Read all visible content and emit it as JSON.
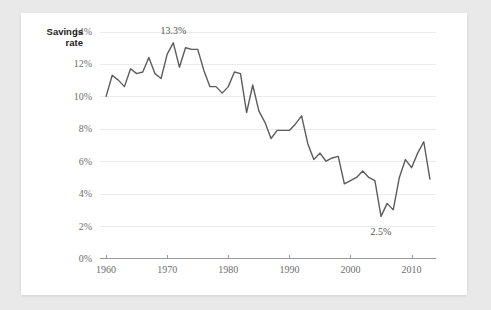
{
  "card": {
    "background": "#ffffff",
    "page_background": "#e9e9e9"
  },
  "chart_data": {
    "type": "line",
    "title": "",
    "series_label_line1": "Savings",
    "series_label_line2": "rate",
    "xlabel": "",
    "ylabel": "Savings rate",
    "xlim": [
      1959,
      2014
    ],
    "ylim": [
      0,
      14
    ],
    "grid": true,
    "legend_position": "none",
    "line_color": "#5c5c5c",
    "ytick_labels": [
      "0%",
      "2%",
      "4%",
      "6%",
      "8%",
      "10%",
      "12%",
      "14%"
    ],
    "ytick_values": [
      0,
      2,
      4,
      6,
      8,
      10,
      12,
      14
    ],
    "xtick_labels": [
      "1960",
      "1970",
      "1980",
      "1990",
      "2000",
      "2010"
    ],
    "xtick_values": [
      1960,
      1970,
      1980,
      1990,
      2000,
      2010
    ],
    "annotations": [
      {
        "label": "13.3%",
        "x": 1971,
        "y": 13.3
      },
      {
        "label": "2.5%",
        "x": 2005,
        "y": 2.5
      }
    ],
    "x": [
      1960,
      1961,
      1962,
      1963,
      1964,
      1965,
      1966,
      1967,
      1968,
      1969,
      1970,
      1971,
      1972,
      1973,
      1974,
      1975,
      1976,
      1977,
      1978,
      1979,
      1980,
      1981,
      1982,
      1983,
      1984,
      1985,
      1986,
      1987,
      1988,
      1989,
      1990,
      1991,
      1992,
      1993,
      1994,
      1995,
      1996,
      1997,
      1998,
      1999,
      2000,
      2001,
      2002,
      2003,
      2004,
      2005,
      2006,
      2007,
      2008,
      2009,
      2010,
      2011,
      2012,
      2013
    ],
    "values": [
      10.0,
      11.3,
      11.0,
      10.6,
      11.7,
      11.4,
      11.5,
      12.4,
      11.4,
      11.1,
      12.6,
      13.3,
      11.8,
      13.0,
      12.9,
      12.9,
      11.6,
      10.6,
      10.6,
      10.2,
      10.6,
      11.5,
      11.4,
      9.0,
      10.7,
      9.1,
      8.4,
      7.4,
      7.9,
      7.9,
      7.9,
      8.3,
      8.8,
      7.1,
      6.1,
      6.5,
      6.0,
      6.2,
      6.3,
      4.6,
      4.8,
      5.0,
      5.4,
      5.0,
      4.8,
      2.6,
      3.4,
      3.0,
      5.0,
      6.1,
      5.6,
      6.5,
      7.2,
      4.9
    ]
  }
}
